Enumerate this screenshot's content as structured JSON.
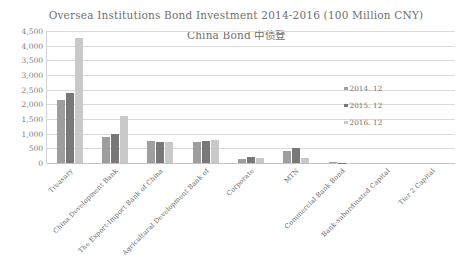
{
  "chart_data": {
    "type": "bar",
    "title": "Oversea Institutions Bond Investment 2014-2016 (100 Million CNY)",
    "subtitle": "China Bond 中债登",
    "xlabel": "",
    "ylabel": "",
    "ylim": [
      0,
      4500
    ],
    "ytick_labels": [
      "4,500",
      "4,000",
      "3,500",
      "3,000",
      "2,500",
      "2,000",
      "1,500",
      "1,000",
      "500",
      "0"
    ],
    "ytick_values": [
      4500,
      4000,
      3500,
      3000,
      2500,
      2000,
      1500,
      1000,
      500,
      0
    ],
    "grid": true,
    "legend_position": "inside-right",
    "categories": [
      "Treasury",
      "China Development Bank",
      "The Export-Import Bank of China",
      "Agricultural Development Bank of",
      "Corporate",
      "MTN",
      "Commercial Bank Bond",
      "Bank-subordinated Capital",
      "Tier 2 Capital"
    ],
    "series": [
      {
        "name": "2014. 12",
        "color": "#9e9e9e",
        "values": [
          2150,
          870,
          750,
          700,
          130,
          420,
          20,
          0,
          0
        ]
      },
      {
        "name": "2015. 12",
        "color": "#787878",
        "values": [
          2400,
          1000,
          700,
          760,
          190,
          500,
          10,
          0,
          0
        ]
      },
      {
        "name": "2016. 12",
        "color": "#c9c9c9",
        "values": [
          4250,
          1600,
          700,
          800,
          160,
          180,
          5,
          0,
          0
        ]
      }
    ]
  },
  "colors": {
    "grid": "#dadada",
    "axis": "#c2c2c2",
    "text": "#6f6f6f",
    "background": "#ffffff"
  }
}
